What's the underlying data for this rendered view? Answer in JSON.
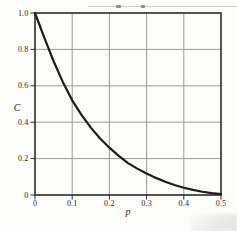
{
  "figure": {
    "background": "#fcfcfa",
    "frame_color": "#2b2b2b",
    "grid_color": "#9b9b96",
    "curve_color": "#1c1c1c",
    "tick_color": "#2b2b2b",
    "label_color": "#2b2b2b"
  },
  "chart_data": {
    "type": "line",
    "title": "",
    "xlabel": "p",
    "ylabel": "C",
    "xlim": [
      0,
      0.5
    ],
    "ylim": [
      0,
      1.0
    ],
    "grid": true,
    "legend": "none",
    "xticks": {
      "values": [
        0,
        0.1,
        0.2,
        0.3,
        0.4,
        0.5
      ],
      "labels": [
        "0",
        "0.1",
        "0.2",
        "0.3",
        "0.4",
        "0.5"
      ]
    },
    "yticks": {
      "values": [
        0,
        0.2,
        0.4,
        0.6,
        0.8,
        1.0
      ],
      "labels": [
        "0",
        "0.2",
        "0.4",
        "0.6",
        "0.8",
        "1.0"
      ]
    },
    "series": [
      {
        "x": [
          0,
          0.025,
          0.05,
          0.075,
          0.1,
          0.125,
          0.15,
          0.175,
          0.2,
          0.225,
          0.25,
          0.275,
          0.3,
          0.325,
          0.35,
          0.375,
          0.4,
          0.425,
          0.45,
          0.475,
          0.5
        ],
        "y": [
          1.0,
          0.865,
          0.735,
          0.62,
          0.52,
          0.44,
          0.37,
          0.31,
          0.26,
          0.215,
          0.175,
          0.145,
          0.118,
          0.094,
          0.073,
          0.055,
          0.04,
          0.028,
          0.018,
          0.01,
          0.005
        ]
      }
    ]
  }
}
